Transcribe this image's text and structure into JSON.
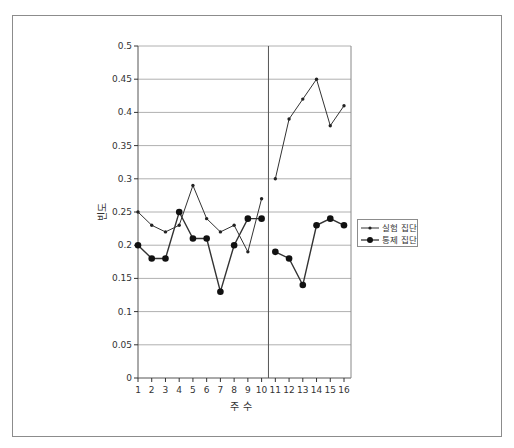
{
  "chart_data": {
    "type": "line",
    "title": "",
    "xlabel": "주 수",
    "ylabel": "빈도",
    "ylim": [
      0,
      0.5
    ],
    "yticks": [
      0,
      0.05,
      0.1,
      0.15,
      0.2,
      0.25,
      0.3,
      0.35,
      0.4,
      0.45,
      0.5
    ],
    "ytick_labels": [
      "0",
      "0.05",
      "0.1",
      "0.15",
      "0.2",
      "0.25",
      "0.3",
      "0.35",
      "0.4",
      "0.45",
      "0.5"
    ],
    "categories": [
      "1",
      "2",
      "3",
      "4",
      "5",
      "6",
      "7",
      "8",
      "9",
      "10",
      "11",
      "12",
      "13",
      "14",
      "15",
      "16"
    ],
    "grid": true,
    "phase_change_line": "between 10 and 11",
    "legend_position": "right",
    "series": [
      {
        "name": "실험 집단",
        "marker": "small-diamond",
        "segments": [
          {
            "x": [
              1,
              2,
              3,
              4,
              5,
              6,
              7,
              8,
              9,
              10
            ],
            "values": [
              0.25,
              0.23,
              0.22,
              0.23,
              0.29,
              0.24,
              0.22,
              0.23,
              0.19,
              0.27
            ]
          },
          {
            "x": [
              11,
              12,
              13,
              14,
              15,
              16
            ],
            "values": [
              0.3,
              0.39,
              0.42,
              0.45,
              0.38,
              0.41
            ]
          }
        ]
      },
      {
        "name": "통제 집단",
        "marker": "large-circle",
        "segments": [
          {
            "x": [
              1,
              2,
              3,
              4,
              5,
              6,
              7,
              8,
              9,
              10
            ],
            "values": [
              0.2,
              0.18,
              0.18,
              0.25,
              0.21,
              0.21,
              0.13,
              0.2,
              0.24,
              0.24
            ]
          },
          {
            "x": [
              11,
              12,
              13,
              14,
              15,
              16
            ],
            "values": [
              0.19,
              0.18,
              0.14,
              0.23,
              0.24,
              0.23
            ]
          }
        ]
      }
    ]
  },
  "legend": {
    "items": [
      {
        "label": "실험 집단"
      },
      {
        "label": "통제 집단"
      }
    ]
  },
  "colors": {
    "line": "#333333",
    "grid": "#b0b0b0",
    "frame": "#8c8c8c"
  }
}
